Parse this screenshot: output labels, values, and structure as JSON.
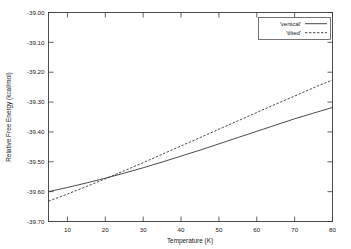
{
  "chart_data": {
    "type": "line",
    "title": "",
    "xlabel": "Temperature (K)",
    "ylabel": "Relative Free Energy (kcal/mol)",
    "xlim": [
      5,
      80
    ],
    "ylim": [
      -39.7,
      -39.0
    ],
    "grid": false,
    "legend_position": "top-right",
    "xticks": [
      10,
      20,
      30,
      40,
      50,
      60,
      70,
      80
    ],
    "xtick_labels": [
      "10",
      "20",
      "30",
      "40",
      "50",
      "60",
      "70",
      "80"
    ],
    "yticks": [
      -39.0,
      -39.1,
      -39.2,
      -39.3,
      -39.4,
      -39.5,
      -39.6,
      -39.7
    ],
    "ytick_labels": [
      "-39.00",
      "-39.10",
      "-39.20",
      "-39.30",
      "-39.40",
      "-39.50",
      "-39.60",
      "-39.70"
    ],
    "x": [
      5,
      10,
      15,
      20,
      25,
      30,
      35,
      40,
      45,
      50,
      55,
      60,
      65,
      70,
      75,
      80
    ],
    "series": [
      {
        "name": "'vertical'",
        "style": "solid",
        "color": "#2b2b2b",
        "values": [
          -39.6,
          -39.586,
          -39.571,
          -39.555,
          -39.538,
          -39.52,
          -39.501,
          -39.481,
          -39.461,
          -39.44,
          -39.419,
          -39.398,
          -39.377,
          -39.356,
          -39.337,
          -39.318
        ]
      },
      {
        "name": "'tilted'",
        "style": "dashed",
        "color": "#2b2b2b",
        "values": [
          -39.632,
          -39.608,
          -39.583,
          -39.557,
          -39.53,
          -39.503,
          -39.475,
          -39.447,
          -39.419,
          -39.391,
          -39.363,
          -39.335,
          -39.307,
          -39.28,
          -39.252,
          -39.226
        ]
      }
    ],
    "annotations": {
      "crossover_temperature_K": 18,
      "crossover_energy_kcal_per_mol": -39.56
    }
  },
  "legend": {
    "entries": [
      {
        "label": "'vertical'",
        "style": "solid"
      },
      {
        "label": "'tilted'",
        "style": "dashed"
      }
    ]
  }
}
